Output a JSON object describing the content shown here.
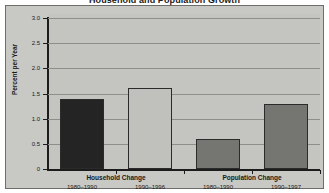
{
  "chart_data": {
    "type": "bar",
    "title": "Household and Population Growth",
    "xlabel": "",
    "ylabel": "Percent per Year",
    "ylim": [
      0,
      3.0
    ],
    "yticks": [
      "0",
      "0.5",
      "1.0",
      "1.5",
      "2.0",
      "2.5",
      "3.0"
    ],
    "ytick_values": [
      0,
      0.5,
      1.0,
      1.5,
      2.0,
      2.5,
      3.0
    ],
    "grid": true,
    "legend": "none",
    "groups": [
      {
        "name": "Household Change",
        "bars": [
          {
            "period": "1980–1990",
            "value": 1.4,
            "color": "#242424"
          },
          {
            "period": "1990–1996",
            "value": 1.6,
            "color": "#c0c0bc"
          }
        ]
      },
      {
        "name": "Population Change",
        "bars": [
          {
            "period": "1980–1990",
            "value": 0.6,
            "color": "#757571"
          },
          {
            "period": "1990–1997",
            "value": 1.3,
            "color": "#757571"
          }
        ]
      }
    ],
    "categories": [
      "Household Change 1980–1990",
      "Household Change 1990–1996",
      "Population Change 1980–1990",
      "Population Change 1990–1997"
    ],
    "values": [
      1.4,
      1.6,
      0.6,
      1.3
    ],
    "colors": {
      "plot_background": "#c4c4c0",
      "frame_border": "#6d6d6a",
      "gridline": "#8e8e8a",
      "axis": "#1c1c1c",
      "bar_outline": "#2b2b2b",
      "text": "#1a1a1a"
    }
  }
}
